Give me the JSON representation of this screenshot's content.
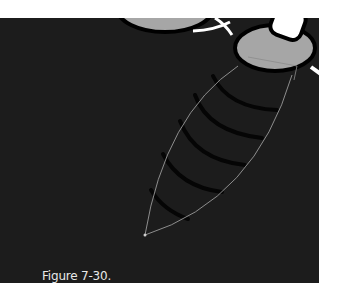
{
  "figure": {
    "caption": "Figure 7-30.",
    "colors": {
      "background": "#1c1c1c",
      "gray_shape": "#a6a6a6",
      "outline": "#000000",
      "white_stroke": "#ffffff",
      "path_line": "#9a9a9a",
      "caption_text": "#e8e8e8"
    },
    "icons": {
      "large_circle_left": "gray-circle-shape",
      "large_circle_right": "gray-circle-shape",
      "white_rounded_bar": "white-rounded-rect-shape",
      "leaf_path": "bezier-leaf-path",
      "arc_stripes": "dark-arc-stripes"
    }
  }
}
